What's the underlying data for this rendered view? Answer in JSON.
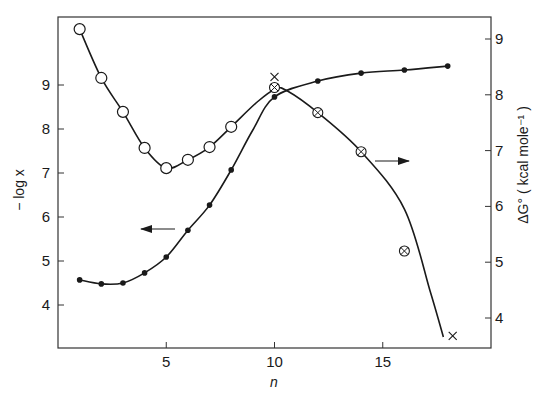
{
  "chart_data": {
    "type": "line",
    "title": "",
    "xlabel": "n",
    "ylabel_left": "− log x",
    "ylabel_right": "ΔG° ( kcal mole⁻¹ )",
    "xlim": [
      0,
      20
    ],
    "ylim_left": [
      3.0,
      10.55
    ],
    "ylim_right": [
      3.48,
      9.4
    ],
    "x_ticks": [
      5,
      10,
      15
    ],
    "y_ticks_left": [
      4,
      5,
      6,
      7,
      8,
      9
    ],
    "y_ticks_right": [
      4,
      5,
      6,
      7,
      8,
      9
    ],
    "grid": false,
    "legend": "none; arrows indicate axis: left arrow on filled-dot curve (−log x), right arrow on crossed-circle curve (ΔG°)",
    "series": [
      {
        "name": "open circles (−log x)",
        "axis": "left",
        "marker": "open-circle",
        "x": [
          1,
          2,
          3,
          4,
          5,
          6,
          7,
          8
        ],
        "values": [
          10.27,
          9.16,
          8.39,
          7.57,
          7.11,
          7.3,
          7.59,
          8.05
        ]
      },
      {
        "name": "filled dots (−log x)",
        "axis": "left",
        "marker": "filled-dot",
        "x": [
          1,
          2,
          3,
          4,
          5,
          6,
          7,
          8,
          10,
          12,
          14,
          16,
          18
        ],
        "values": [
          4.57,
          4.48,
          4.5,
          4.73,
          5.09,
          5.7,
          6.27,
          7.07,
          8.73,
          9.09,
          9.27,
          9.34,
          9.43
        ]
      },
      {
        "name": "crossed circles (ΔG°)",
        "axis": "right",
        "marker": "crossed-circle",
        "x": [
          10,
          12,
          14,
          16
        ],
        "values": [
          8.13,
          7.68,
          6.98,
          5.2
        ]
      },
      {
        "name": "crosses (ΔG°)",
        "axis": "right",
        "marker": "cross",
        "x": [
          10,
          18
        ],
        "values": [
          8.32,
          3.68
        ]
      }
    ],
    "curves": [
      {
        "name": "fit through open circles continuing into ΔG° curve",
        "x": [
          1,
          2,
          3,
          4,
          5,
          6,
          7,
          8,
          9,
          10,
          10.5,
          12,
          14,
          16,
          17,
          17.8
        ],
        "axis_note": "pixel-traced"
      }
    ],
    "annotations": [
      {
        "type": "arrow",
        "direction": "left",
        "near_n": 4.5,
        "meaning": "filled-dot curve refers to left axis"
      },
      {
        "type": "arrow",
        "direction": "right",
        "near_n": 15.5,
        "meaning": "crossed-circle curve refers to right axis"
      }
    ]
  },
  "labels": {
    "x_axis": "n",
    "left_axis": "− log x",
    "right_axis": "ΔG° ( kcal mole⁻¹ )"
  }
}
